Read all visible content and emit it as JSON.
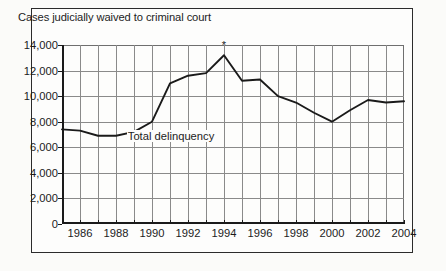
{
  "chart_data": {
    "type": "line",
    "title": "Cases judicially waived to criminal court",
    "xlabel": "",
    "ylabel": "",
    "ylim": [
      0,
      14000
    ],
    "ytick_labels": [
      "14,000",
      "12,000",
      "10,000",
      "8,000",
      "6,000",
      "4,000",
      "2,000",
      "0"
    ],
    "ytick_values": [
      14000,
      12000,
      10000,
      8000,
      6000,
      4000,
      2000,
      0
    ],
    "xtick_labels": [
      "1986",
      "1988",
      "1990",
      "1992",
      "1994",
      "1996",
      "1998",
      "2000",
      "2002",
      "2004"
    ],
    "xtick_values": [
      1986,
      1988,
      1990,
      1992,
      1994,
      1996,
      1998,
      2000,
      2002,
      2004
    ],
    "xlim": [
      1985,
      2004
    ],
    "grid": true,
    "legend_position": "inline",
    "series": [
      {
        "name": "Total delinquency",
        "x": [
          1985,
          1986,
          1987,
          1988,
          1989,
          1990,
          1991,
          1992,
          1993,
          1994,
          1995,
          1996,
          1997,
          1998,
          1999,
          2000,
          2001,
          2002,
          2003,
          2004
        ],
        "values": [
          7400,
          7300,
          6900,
          6900,
          7200,
          8000,
          11000,
          11600,
          11800,
          13200,
          11200,
          11300,
          10000,
          9500,
          8700,
          8000,
          8900,
          9700,
          9500,
          9600
        ]
      }
    ],
    "annotations": [
      {
        "label": "*",
        "x": 1994,
        "y": 13200,
        "note": "asterisk marker above 1994 peak"
      }
    ],
    "series_label": "Total delinquency"
  }
}
